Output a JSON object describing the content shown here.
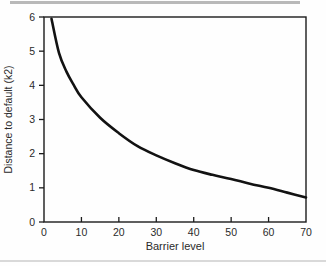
{
  "page": {
    "background": "#fefefe"
  },
  "chart_data": {
    "type": "line",
    "title": "",
    "xlabel": "Barrier level",
    "ylabel": "Distance to default (k2)",
    "xlim": [
      0,
      70
    ],
    "ylim": [
      0,
      6
    ],
    "xticks": [
      0,
      10,
      20,
      30,
      40,
      50,
      60,
      70
    ],
    "yticks": [
      0,
      1,
      2,
      3,
      4,
      5,
      6
    ],
    "grid": false,
    "legend": null,
    "axis_color": "#1c1c1c",
    "text_color": "#2a2a2a",
    "series": [
      {
        "name": "distance-to-default",
        "color": "#121212",
        "x": [
          2,
          4,
          6,
          8,
          10,
          15,
          20,
          25,
          30,
          35,
          40,
          45,
          50,
          55,
          60,
          65,
          70
        ],
        "y": [
          5.95,
          4.95,
          4.4,
          4.0,
          3.65,
          3.05,
          2.6,
          2.22,
          1.95,
          1.72,
          1.52,
          1.38,
          1.26,
          1.12,
          1.0,
          0.86,
          0.72
        ]
      }
    ]
  }
}
